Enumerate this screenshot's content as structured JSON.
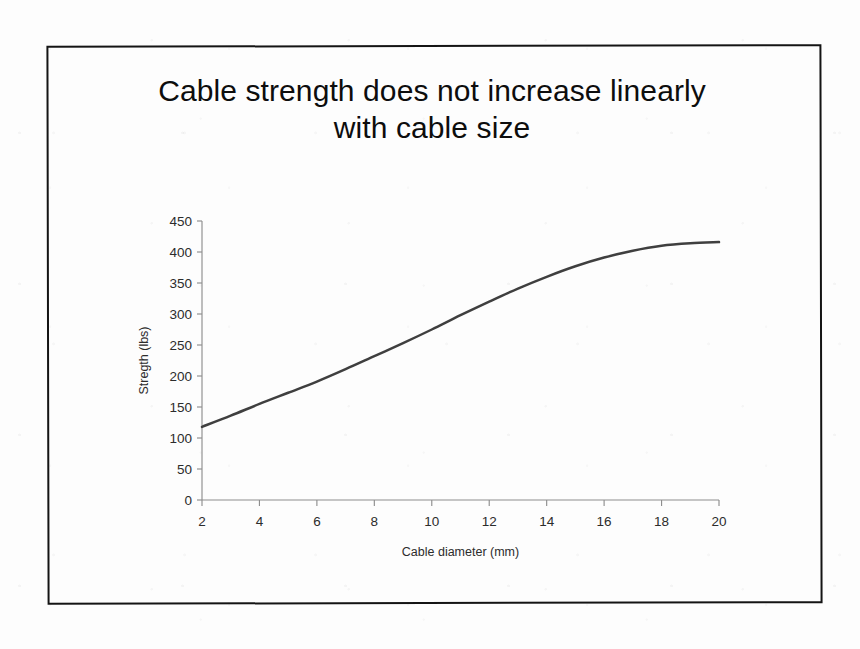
{
  "slide": {
    "title_line_1": "Cable strength does not increase linearly",
    "title_line_2": "with cable size",
    "frame_color": "#141414",
    "background_color": "#fdfdfd"
  },
  "chart_data": {
    "type": "line",
    "title": "Cable strength does not increase linearly with cable size",
    "xlabel": "Cable diameter (mm)",
    "ylabel": "Stregth (lbs)",
    "xlim": [
      2,
      20
    ],
    "ylim": [
      0,
      450
    ],
    "grid": false,
    "legend": null,
    "line_color": "#3f3f3f",
    "x_tick_labels": [
      "2",
      "4",
      "6",
      "8",
      "10",
      "12",
      "14",
      "16",
      "18",
      "20"
    ],
    "y_tick_labels": [
      "0",
      "50",
      "100",
      "150",
      "200",
      "250",
      "300",
      "350",
      "400",
      "450"
    ],
    "x_ticks": [
      2,
      4,
      6,
      8,
      10,
      12,
      14,
      16,
      18,
      20
    ],
    "y_ticks": [
      0,
      50,
      100,
      150,
      200,
      250,
      300,
      350,
      400,
      450
    ],
    "series": [
      {
        "name": "Cable strength",
        "x": [
          2,
          3,
          4,
          5,
          6,
          7,
          8,
          9,
          10,
          11,
          12,
          13,
          14,
          15,
          16,
          17,
          18,
          19,
          20
        ],
        "values": [
          118,
          136,
          155,
          173,
          191,
          211,
          232,
          253,
          275,
          298,
          320,
          341,
          360,
          377,
          391,
          402,
          410,
          414,
          416
        ]
      }
    ]
  }
}
